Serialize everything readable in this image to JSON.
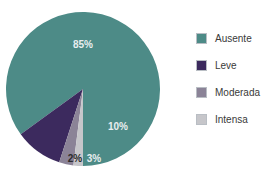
{
  "chart_data": {
    "type": "pie",
    "title": "",
    "subtitle": "",
    "xlabel": "",
    "ylabel": "",
    "grid": false,
    "legend_position": "right",
    "categories": [
      "Ausente",
      "Leve",
      "Moderada",
      "Intensa"
    ],
    "values": [
      85,
      10,
      3,
      2
    ],
    "value_labels": [
      "85%",
      "10%",
      "3%",
      "2%"
    ],
    "colors": [
      "#4d8b87",
      "#3c2a5e",
      "#8b8397",
      "#c6c6ca"
    ],
    "slices": [
      {
        "name": "Ausente",
        "value": 85,
        "label": "85%",
        "color": "#4d8b87",
        "label_color": "#e9eef0"
      },
      {
        "name": "Leve",
        "value": 10,
        "label": "10%",
        "color": "#3c2a5e",
        "label_color": "#e9eef0"
      },
      {
        "name": "Moderada",
        "value": 3,
        "label": "3%",
        "color": "#8b8397",
        "label_color": "#e9eef0"
      },
      {
        "name": "Intensa",
        "value": 2,
        "label": "2%",
        "color": "#c6c6ca",
        "label_color": "#2b2b2b"
      }
    ],
    "geometry": {
      "center_x": 83,
      "center_y": 89,
      "radius": 77,
      "start_angle_deg": 90,
      "direction": "counterclockwise"
    }
  },
  "legend": {
    "items": [
      {
        "label": "Ausente",
        "color": "#4d8b87"
      },
      {
        "label": "Leve",
        "color": "#3c2a5e"
      },
      {
        "label": "Moderada",
        "color": "#8b8397"
      },
      {
        "label": "Intensa",
        "color": "#c6c6ca"
      }
    ]
  },
  "slice_label_positions": [
    {
      "x": 83,
      "y": 48
    },
    {
      "x": 118,
      "y": 130
    },
    {
      "x": 94,
      "y": 162
    },
    {
      "x": 75,
      "y": 162
    }
  ]
}
